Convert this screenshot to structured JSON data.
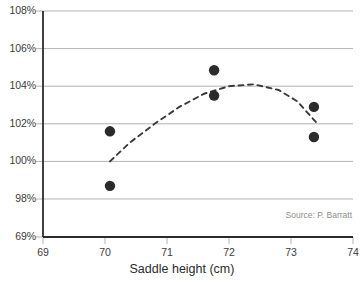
{
  "chart_data": {
    "type": "scatter",
    "title": "",
    "xlabel": "Saddle height (cm)",
    "ylabel": "",
    "xlim": [
      69,
      74
    ],
    "ylim": [
      69,
      108
    ],
    "grid": true,
    "legend": null,
    "x_ticks": [
      {
        "value": 69,
        "label": "69"
      },
      {
        "value": 70,
        "label": "70"
      },
      {
        "value": 71,
        "label": "71"
      },
      {
        "value": 72,
        "label": "72"
      },
      {
        "value": 73,
        "label": "73"
      },
      {
        "value": 74,
        "label": "74"
      }
    ],
    "y_ticks": [
      {
        "value": 108,
        "label": "108%"
      },
      {
        "value": 106,
        "label": "106%"
      },
      {
        "value": 104,
        "label": "104%"
      },
      {
        "value": 102,
        "label": "102%"
      },
      {
        "value": 100,
        "label": "100%"
      },
      {
        "value": 98,
        "label": "98%"
      },
      {
        "value": 69,
        "label": "69%"
      }
    ],
    "series": [
      {
        "name": "observations",
        "type": "scatter",
        "marker": "circle",
        "color": "#2b2b2b",
        "points": [
          {
            "x": 70.08,
            "y": 101.6
          },
          {
            "x": 70.08,
            "y": 98.7
          },
          {
            "x": 71.76,
            "y": 104.85
          },
          {
            "x": 71.76,
            "y": 103.5
          },
          {
            "x": 73.37,
            "y": 102.9
          },
          {
            "x": 73.37,
            "y": 101.3
          }
        ]
      },
      {
        "name": "fitted-trend",
        "type": "line",
        "style": "dashed",
        "color": "#3a3a3a",
        "points": [
          {
            "x": 70.08,
            "y": 100.0
          },
          {
            "x": 70.4,
            "y": 101.0
          },
          {
            "x": 70.8,
            "y": 102.0
          },
          {
            "x": 71.2,
            "y": 102.9
          },
          {
            "x": 71.6,
            "y": 103.6
          },
          {
            "x": 72.0,
            "y": 104.0
          },
          {
            "x": 72.4,
            "y": 104.1
          },
          {
            "x": 72.8,
            "y": 103.8
          },
          {
            "x": 73.1,
            "y": 103.2
          },
          {
            "x": 73.4,
            "y": 102.1
          }
        ]
      }
    ],
    "annotations": [
      {
        "name": "source",
        "text": "Source: P. Barratt"
      }
    ]
  },
  "colors": {
    "background": "#ffffff",
    "gridline": "#b3b3b3",
    "axis": "#2b2b2b",
    "marker": "#2b2b2b",
    "trend": "#3a3a3a",
    "tick_text": "#3b3b3b",
    "title_text": "#2b2b2b",
    "source_text": "#8d8d8d"
  }
}
